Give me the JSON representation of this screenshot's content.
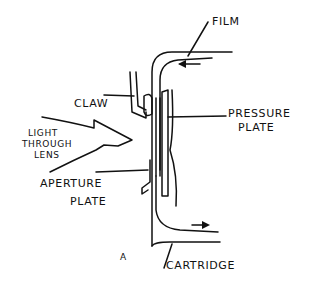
{
  "diagram": {
    "type": "hand-drawn mechanical sketch",
    "labels": {
      "film": "FILM",
      "claw": "CLAW",
      "pressure_plate_line1": "PRESSURE",
      "pressure_plate_line2": "PLATE",
      "light_line1": "LIGHT",
      "light_line2": "THROUGH",
      "light_line3": "LENS",
      "aperture_line1": "APERTURE",
      "aperture_line2": "PLATE",
      "cartridge": "CARTRIDGE",
      "figure_letter": "A"
    },
    "arrows": {
      "film_top_direction": "left",
      "film_bottom_direction": "right",
      "light_direction": "right"
    },
    "colors": {
      "ink": "#111111",
      "background": "#ffffff"
    }
  }
}
